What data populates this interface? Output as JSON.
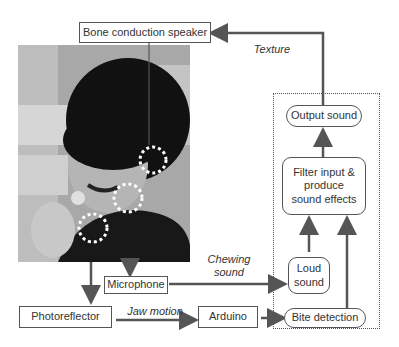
{
  "diagram": {
    "nodes": {
      "speaker": "Bone conduction speaker",
      "output_sound": "Output sound",
      "filter": "Filter input & produce sound effects",
      "loud_sound": "Loud sound",
      "bite_detection": "Bite detection",
      "microphone": "Microphone",
      "photoreflector": "Photoreflector",
      "arduino": "Arduino"
    },
    "edge_labels": {
      "texture": "Texture",
      "chewing_sound": "Chewing sound",
      "jaw_motion": "Jaw motion"
    },
    "photo": {
      "description": "Person wearing sensors eating a chip",
      "sensor_markers": 3
    }
  }
}
